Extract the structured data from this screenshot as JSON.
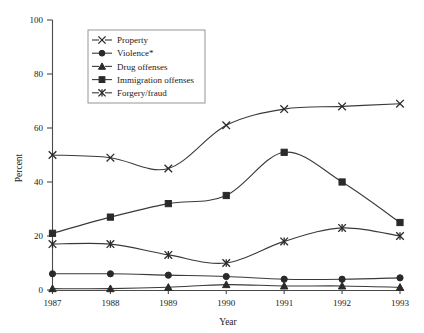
{
  "chart_data": {
    "type": "line",
    "title": "",
    "xlabel": "Year",
    "ylabel": "Percent",
    "categories": [
      "1987",
      "1988",
      "1989",
      "1990",
      "1991",
      "1992",
      "1993"
    ],
    "x": [
      1987,
      1988,
      1989,
      1990,
      1991,
      1992,
      1993
    ],
    "xlim": [
      1987,
      1993
    ],
    "ylim": [
      0,
      100
    ],
    "yticks": [
      0,
      20,
      40,
      60,
      80,
      100
    ],
    "ytick_labels": [
      "0",
      "20",
      "40",
      "60",
      "80",
      "100"
    ],
    "grid": false,
    "legend_position": "top-center",
    "series": [
      {
        "name": "Property",
        "marker": "x",
        "values": [
          50,
          49,
          45,
          61,
          67,
          68,
          69
        ]
      },
      {
        "name": "Violence*",
        "marker": "circle",
        "values": [
          6,
          6,
          5.5,
          5,
          4,
          4,
          4.5
        ]
      },
      {
        "name": "Drug offenses",
        "marker": "triangle",
        "values": [
          0.5,
          0.5,
          1,
          2,
          1.5,
          1.5,
          1
        ]
      },
      {
        "name": "Immigration offenses",
        "marker": "square",
        "values": [
          21,
          27,
          32,
          35,
          51,
          40,
          25
        ]
      },
      {
        "name": "Forgery/fraud",
        "marker": "asterisk",
        "values": [
          17,
          17,
          13,
          10,
          18,
          23,
          20
        ]
      }
    ]
  },
  "legend": {
    "entries": [
      {
        "label": "Property",
        "marker": "x"
      },
      {
        "label": "Violence*",
        "marker": "circle"
      },
      {
        "label": "Drug offenses",
        "marker": "triangle"
      },
      {
        "label": "Immigration offenses",
        "marker": "square"
      },
      {
        "label": "Forgery/fraud",
        "marker": "asterisk"
      }
    ]
  },
  "axes": {
    "y_title": "Percent",
    "x_title": "Year"
  },
  "colors": {
    "line": "#3a3a3a",
    "axis": "#4a4a4a",
    "marker": "#2a2a2a",
    "background": "#ffffff",
    "legend_border": "#8a8a8a"
  }
}
